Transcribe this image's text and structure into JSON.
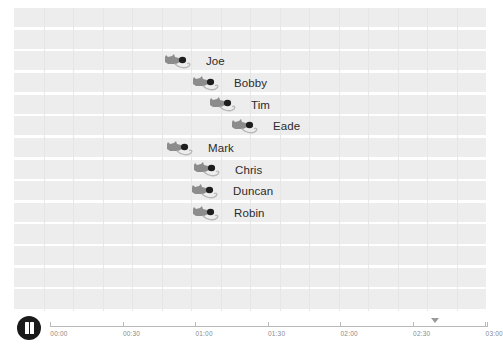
{
  "app": {
    "title": "Mouse Race Timeline",
    "background_color": "#ffffff",
    "lane_band_color": "#ededed",
    "lane_separator_color": "#ffffff"
  },
  "controls": {
    "play_pause": {
      "name": "pause-button",
      "state": "playing",
      "label": "Pause",
      "icon": "pause-icon",
      "color": "#1a1a1a"
    }
  },
  "timeline": {
    "axis_color": "#b9b9b9",
    "tick_label_color": "#8a8a8a",
    "playhead": {
      "label": "playhead-marker",
      "time": "02:46",
      "position_pct": 88.0,
      "color": "#9a9a9a"
    },
    "ticks": [
      {
        "label": "00:00",
        "position_pct": 0.0
      },
      {
        "label": "00:30",
        "position_pct": 16.6
      },
      {
        "label": "01:00",
        "position_pct": 33.2
      },
      {
        "label": "01:30",
        "position_pct": 49.8
      },
      {
        "label": "02:00",
        "position_pct": 66.4
      },
      {
        "label": "02:30",
        "position_pct": 83.0
      },
      {
        "label": "03:00",
        "position_pct": 99.6
      }
    ]
  },
  "race": {
    "icon_name": "mouse-racer-icon",
    "lane_count": 14,
    "racers": [
      {
        "name": "Joe",
        "lane": 2,
        "position_px": 163,
        "label_color": "#2b2b2b"
      },
      {
        "name": "Bobby",
        "lane": 3,
        "position_px": 191,
        "label_color": "#2b2b2b"
      },
      {
        "name": "Tim",
        "lane": 4,
        "position_px": 208,
        "label_color": "#2b2b2b"
      },
      {
        "name": "Eade",
        "lane": 5,
        "position_px": 230,
        "label_color": "#2b2b2b"
      },
      {
        "name": "Mark",
        "lane": 6,
        "position_px": 165,
        "label_color": "#2b2b2b"
      },
      {
        "name": "Chris",
        "lane": 7,
        "position_px": 192,
        "label_color": "#2b2b2b"
      },
      {
        "name": "Duncan",
        "lane": 8,
        "position_px": 190,
        "label_color": "#2b2b2b"
      },
      {
        "name": "Robin",
        "lane": 9,
        "position_px": 191,
        "label_color": "#2b2b2b"
      }
    ]
  }
}
